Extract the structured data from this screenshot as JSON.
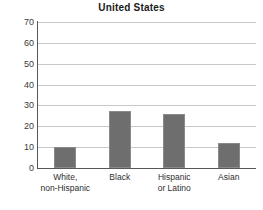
{
  "chart_data": {
    "type": "bar",
    "title": "United States",
    "xlabel": "",
    "ylabel": "",
    "ylim": [
      0,
      70
    ],
    "yticks": [
      0,
      10,
      20,
      30,
      40,
      50,
      60,
      70
    ],
    "grid": true,
    "legend": null,
    "bar_color": "#6e6e6e",
    "categories": [
      "White, non-Hispanic",
      "Black",
      "Hispanic or Latino",
      "Asian"
    ],
    "category_lines": [
      [
        "White,",
        "non-Hispanic"
      ],
      [
        "Black",
        ""
      ],
      [
        "Hispanic",
        "or Latino"
      ],
      [
        "Asian",
        ""
      ]
    ],
    "values": [
      10,
      27.5,
      26,
      12
    ]
  }
}
